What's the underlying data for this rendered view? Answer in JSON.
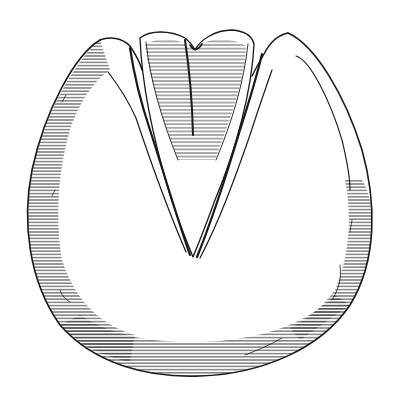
{
  "image": {
    "subject": "Engraved illustration of a horse hoof, sole view",
    "style": "black-and-white line engraving with horizontal hatching",
    "colors": {
      "background": "#ffffff",
      "ink": "#1a1a1a",
      "hatch": "#2b2b2b"
    },
    "parts": [
      {
        "name": "hoof-wall",
        "description": "rounded outer wall of hoof, hatched along left, bottom and right edges"
      },
      {
        "name": "sole",
        "description": "smooth unshaded central sole area"
      },
      {
        "name": "frog",
        "description": "V-shaped frog at top center, hatched, with central cleft"
      },
      {
        "name": "bars",
        "description": "two diagonal bars flanking the frog forming heel angles"
      },
      {
        "name": "heels",
        "description": "two pointed heel bulbs at top left and top right"
      }
    ]
  }
}
